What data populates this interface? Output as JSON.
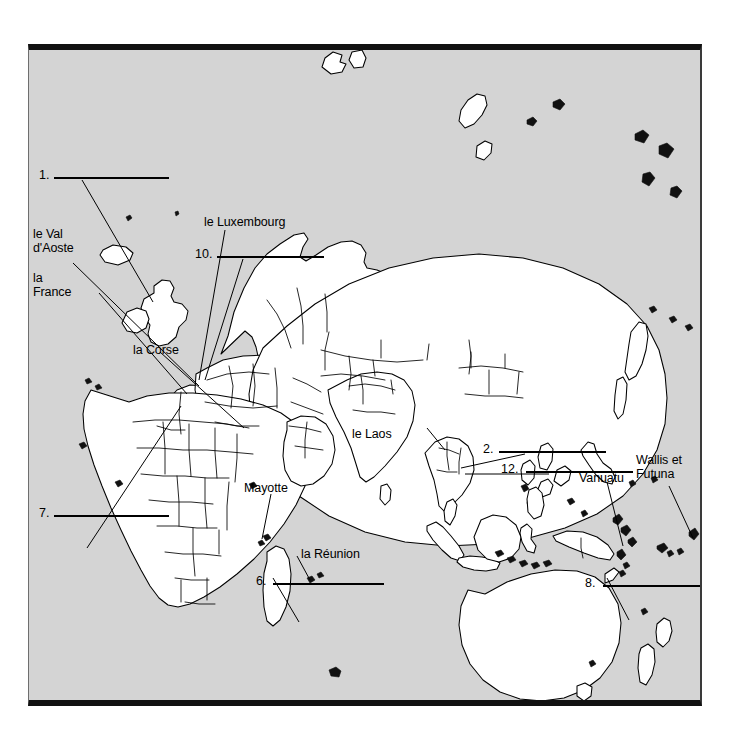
{
  "page": {
    "top_clipped_text": "",
    "background_color": "#ffffff",
    "map_background_color": "#d4d4d4",
    "land_color": "#ffffff",
    "outline_color": "#000000"
  },
  "map": {
    "title": "",
    "type": "blank-outline-world-map",
    "region": "Eurasia, Africa, Oceania",
    "named_labels": [
      {
        "id": "label-1",
        "text": "le Val\nd'Aoste",
        "x": 32,
        "y": 227
      },
      {
        "id": "label-2",
        "text": "la\nFrance",
        "x": 32,
        "y": 270
      },
      {
        "id": "label-3",
        "text": "le Luxembourg",
        "x": 203,
        "y": 214
      },
      {
        "id": "label-4",
        "text": "la Corse",
        "x": 133,
        "y": 344
      },
      {
        "id": "label-5",
        "text": "le Laos",
        "x": 351,
        "y": 429
      },
      {
        "id": "label-6",
        "text": "Mayotte",
        "x": 243,
        "y": 480
      },
      {
        "id": "label-7",
        "text": "la Réunion",
        "x": 300,
        "y": 541
      },
      {
        "id": "label-8",
        "text": "Vanuatu",
        "x": 578,
        "y": 470
      },
      {
        "id": "label-9",
        "text": "Wallis et\nFutuna",
        "x": 635,
        "y": 452
      }
    ],
    "numbered_blanks": [
      {
        "number": "1.",
        "x": 38,
        "y": 160,
        "rule_x": 53,
        "rule_y": 172,
        "rule_w": 88
      },
      {
        "number": "10.",
        "x": 194,
        "y": 241,
        "rule_x": 216,
        "rule_y": 253,
        "rule_w": 84
      },
      {
        "number": "7.",
        "x": 38,
        "y": 498,
        "rule_x": 53,
        "rule_y": 510,
        "rule_w": 88
      },
      {
        "number": "6.",
        "x": 255,
        "y": 565,
        "rule_x": 272,
        "rule_y": 577,
        "rule_w": 85
      },
      {
        "number": "2.",
        "x": 482,
        "y": 397,
        "rule_x": 498,
        "rule_y": 409,
        "rule_w": 92
      },
      {
        "number": "12.",
        "x": 500,
        "y": 416,
        "rule_x": 524,
        "rule_y": 428,
        "rule_w": 90
      },
      {
        "number": "8.",
        "x": 592,
        "y": 568,
        "rule_x": 608,
        "rule_y": 580,
        "rule_w": 88
      }
    ]
  }
}
